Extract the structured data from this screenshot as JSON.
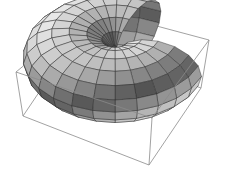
{
  "chart_data": {
    "type": "surface3d",
    "title": "",
    "surface": {
      "kind": "torus",
      "major_radius": 1.0,
      "minor_radius": 1.0,
      "u_range_deg": [
        40,
        320
      ],
      "v_range_deg": [
        0,
        360
      ],
      "u_segments": 20,
      "v_segments": 16
    },
    "axes": {
      "shown": false,
      "ticks": [],
      "labels": []
    },
    "box": {
      "shown": true,
      "corners_px": {
        "top_back": [
          93,
          9
        ],
        "top_left": [
          16,
          72
        ],
        "top_front": [
          152,
          118
        ],
        "top_right": [
          209,
          40
        ],
        "bottom_left": [
          23,
          116
        ],
        "bottom_front": [
          149,
          165
        ],
        "bottom_right": [
          201,
          88
        ]
      },
      "color": "#8a8a8a"
    },
    "colors": {
      "mesh_line": "#2a2a2a",
      "light": "#f2f2f2",
      "dark": "#1e1e1e",
      "background": "#ffffff"
    }
  }
}
